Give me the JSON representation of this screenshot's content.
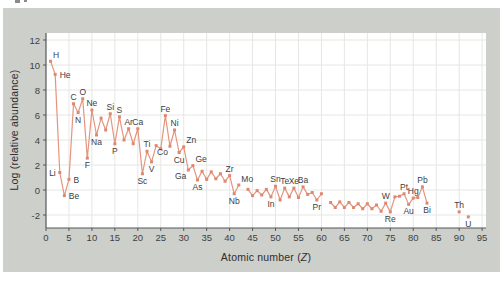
{
  "page": {
    "background": "#ffffff",
    "panel_color": "#cdcfcb"
  },
  "chart_data": {
    "type": "line",
    "title": "",
    "series_name": "Log relative abundance of the elements by atomic number",
    "xlabel": {
      "prefix": "Atomic number (",
      "variable": "Z",
      "suffix": ")"
    },
    "ylabel": "Log (relative abundance)",
    "x_ticks": [
      0,
      5,
      10,
      15,
      20,
      25,
      30,
      35,
      40,
      45,
      50,
      55,
      60,
      65,
      70,
      75,
      80,
      85,
      90,
      95
    ],
    "y_ticks": [
      -2,
      0,
      2,
      4,
      6,
      8,
      10,
      12
    ],
    "xlim": [
      0,
      95.9
    ],
    "ylim": [
      -3.05,
      12.55
    ],
    "grid": true,
    "legend": "none",
    "colors": {
      "line": "#e5947f",
      "marker": "#df8870",
      "grid": "#e4e7e4",
      "axis": "#55565a",
      "tick_text": "#3f3f3f",
      "label_text": "#3d3d3d"
    },
    "points": [
      {
        "z": 1,
        "symbol": "H",
        "v": 10.3,
        "lp": "above-right"
      },
      {
        "z": 2,
        "symbol": "He",
        "v": 9.25,
        "lp": "right"
      },
      {
        "z": 3,
        "symbol": "Li",
        "v": 1.4,
        "lp": "left"
      },
      {
        "z": 4,
        "symbol": "Be",
        "v": -0.45,
        "lp": "right"
      },
      {
        "z": 5,
        "symbol": "B",
        "v": 0.85,
        "lp": "right"
      },
      {
        "z": 6,
        "symbol": "C",
        "v": 6.9,
        "lp": "above"
      },
      {
        "z": 7,
        "symbol": "N",
        "v": 6.2,
        "lp": "below"
      },
      {
        "z": 8,
        "symbol": "O",
        "v": 7.3,
        "lp": "above"
      },
      {
        "z": 9,
        "symbol": "F",
        "v": 2.55,
        "lp": "below"
      },
      {
        "z": 10,
        "symbol": "Ne",
        "v": 6.4,
        "lp": "above"
      },
      {
        "z": 11,
        "symbol": "Na",
        "v": 4.4,
        "lp": "below"
      },
      {
        "z": 12,
        "symbol": "Mg",
        "v": 5.75
      },
      {
        "z": 13,
        "symbol": "Al",
        "v": 4.8
      },
      {
        "z": 14,
        "symbol": "Si",
        "v": 6.1,
        "lp": "above"
      },
      {
        "z": 15,
        "symbol": "P",
        "v": 3.7,
        "lp": "below"
      },
      {
        "z": 16,
        "symbol": "S",
        "v": 5.85,
        "lp": "above"
      },
      {
        "z": 17,
        "symbol": "Cl",
        "v": 4.0
      },
      {
        "z": 18,
        "symbol": "Ar",
        "v": 4.9,
        "lp": "above"
      },
      {
        "z": 19,
        "symbol": "K",
        "v": 3.7
      },
      {
        "z": 20,
        "symbol": "Ca",
        "v": 4.9,
        "lp": "above"
      },
      {
        "z": 21,
        "symbol": "Sc",
        "v": 1.3,
        "lp": "below"
      },
      {
        "z": 22,
        "symbol": "Ti",
        "v": 3.1,
        "lp": "above"
      },
      {
        "z": 23,
        "symbol": "V",
        "v": 2.25,
        "lp": "below"
      },
      {
        "z": 24,
        "symbol": "Cr",
        "v": 3.55
      },
      {
        "z": 25,
        "symbol": "Mn",
        "v": 3.3
      },
      {
        "z": 26,
        "symbol": "Fe",
        "v": 5.95,
        "lp": "above"
      },
      {
        "z": 27,
        "symbol": "Co",
        "v": 3.5,
        "lp": "below-left"
      },
      {
        "z": 28,
        "symbol": "Ni",
        "v": 4.8,
        "lp": "above"
      },
      {
        "z": 29,
        "symbol": "Cu",
        "v": 3.0,
        "lp": "below"
      },
      {
        "z": 30,
        "symbol": "Zn",
        "v": 3.45,
        "lp": "above-right"
      },
      {
        "z": 31,
        "symbol": "Ga",
        "v": 1.6,
        "lp": "below-left"
      },
      {
        "z": 32,
        "symbol": "Ge",
        "v": 1.95,
        "lp": "above-right"
      },
      {
        "z": 33,
        "symbol": "As",
        "v": 0.8,
        "lp": "below"
      },
      {
        "z": 34,
        "symbol": "Se",
        "v": 1.5
      },
      {
        "z": 35,
        "symbol": "Br",
        "v": 0.85
      },
      {
        "z": 36,
        "symbol": "Kr",
        "v": 1.45
      },
      {
        "z": 37,
        "symbol": "Rb",
        "v": 0.9
      },
      {
        "z": 38,
        "symbol": "Sr",
        "v": 1.3
      },
      {
        "z": 39,
        "symbol": "Y",
        "v": 0.7
      },
      {
        "z": 40,
        "symbol": "Zr",
        "v": 1.15,
        "lp": "above"
      },
      {
        "z": 41,
        "symbol": "Nb",
        "v": -0.3,
        "lp": "below"
      },
      {
        "z": 42,
        "symbol": "Mo",
        "v": 0.4,
        "lp": "above-right"
      },
      {
        "z": 44,
        "symbol": "Ru",
        "v": 0.05
      },
      {
        "z": 45,
        "symbol": "Rh",
        "v": -0.45
      },
      {
        "z": 46,
        "symbol": "Pd",
        "v": -0.05
      },
      {
        "z": 47,
        "symbol": "Ag",
        "v": -0.4
      },
      {
        "z": 48,
        "symbol": "Cd",
        "v": 0.05
      },
      {
        "z": 49,
        "symbol": "In",
        "v": -0.55,
        "lp": "below"
      },
      {
        "z": 50,
        "symbol": "Sn",
        "v": 0.3,
        "lp": "above"
      },
      {
        "z": 51,
        "symbol": "Sb",
        "v": -0.8
      },
      {
        "z": 52,
        "symbol": "Te",
        "v": 0.15,
        "lp": "above"
      },
      {
        "z": 53,
        "symbol": "I",
        "v": -0.55
      },
      {
        "z": 54,
        "symbol": "Xe",
        "v": 0.15,
        "lp": "above"
      },
      {
        "z": 55,
        "symbol": "Cs",
        "v": -0.6
      },
      {
        "z": 56,
        "symbol": "Ba",
        "v": 0.25,
        "lp": "above"
      },
      {
        "z": 57,
        "symbol": "La",
        "v": -0.35
      },
      {
        "z": 58,
        "symbol": "Ce",
        "v": -0.2
      },
      {
        "z": 59,
        "symbol": "Pr",
        "v": -0.8,
        "lp": "below"
      },
      {
        "z": 60,
        "symbol": "Nd",
        "v": -0.3
      },
      {
        "z": 62,
        "symbol": "Sm",
        "v": -1.0
      },
      {
        "z": 63,
        "symbol": "Eu",
        "v": -1.4
      },
      {
        "z": 64,
        "symbol": "Gd",
        "v": -0.95
      },
      {
        "z": 65,
        "symbol": "Tb",
        "v": -1.4
      },
      {
        "z": 66,
        "symbol": "Dy",
        "v": -1.0
      },
      {
        "z": 67,
        "symbol": "Ho",
        "v": -1.4
      },
      {
        "z": 68,
        "symbol": "Er",
        "v": -1.1
      },
      {
        "z": 69,
        "symbol": "Tm",
        "v": -1.5
      },
      {
        "z": 70,
        "symbol": "Yb",
        "v": -1.1
      },
      {
        "z": 71,
        "symbol": "Lu",
        "v": -1.5
      },
      {
        "z": 72,
        "symbol": "Hf",
        "v": -1.2
      },
      {
        "z": 73,
        "symbol": "Ta",
        "v": -1.7
      },
      {
        "z": 74,
        "symbol": "W",
        "v": -1.05,
        "lp": "above"
      },
      {
        "z": 75,
        "symbol": "Re",
        "v": -1.75,
        "lp": "below"
      },
      {
        "z": 76,
        "symbol": "Os",
        "v": -0.55
      },
      {
        "z": 77,
        "symbol": "Ir",
        "v": -0.5
      },
      {
        "z": 78,
        "symbol": "Pt",
        "v": -0.3,
        "lp": "above"
      },
      {
        "z": 79,
        "symbol": "Au",
        "v": -1.15,
        "lp": "below"
      },
      {
        "z": 80,
        "symbol": "Hg",
        "v": -0.65,
        "lp": "above"
      },
      {
        "z": 81,
        "symbol": "Tl",
        "v": -0.6
      },
      {
        "z": 82,
        "symbol": "Pb",
        "v": 0.25,
        "lp": "above"
      },
      {
        "z": 83,
        "symbol": "Bi",
        "v": -1.05,
        "lp": "below"
      },
      {
        "z": 90,
        "symbol": "Th",
        "v": -1.75,
        "lp": "above"
      },
      {
        "z": 92,
        "symbol": "U",
        "v": -2.15,
        "lp": "below"
      }
    ]
  }
}
